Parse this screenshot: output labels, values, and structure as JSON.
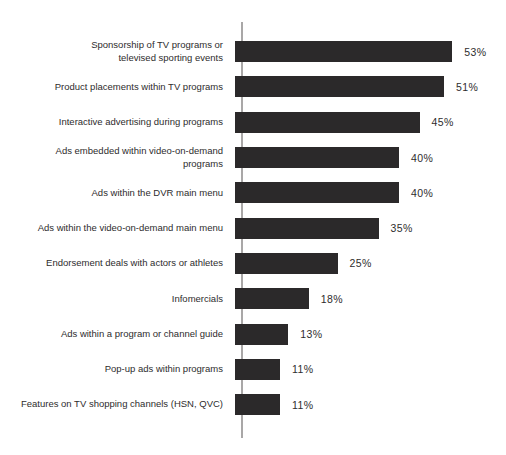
{
  "chart_data": {
    "type": "bar",
    "orientation": "horizontal",
    "title": "",
    "xlabel": "",
    "ylabel": "",
    "unit": "%",
    "xlim": [
      0,
      53
    ],
    "grid": false,
    "legend": null,
    "bar_color": "#2b292a",
    "axis_color": "#a9a7a7",
    "text_color": "#2e2c2d",
    "categories": [
      "Sponsorship of TV programs or\ntelevised sporting events",
      "Product placements within TV programs",
      "Interactive advertising during programs",
      "Ads embedded within video-on-demand\nprograms",
      "Ads within the DVR main menu",
      "Ads within the video-on-demand main menu",
      "Endorsement deals with actors or athletes",
      "Infomercials",
      "Ads within a program or channel guide",
      "Pop-up ads within programs",
      "Features on TV shopping channels (HSN, QVC)"
    ],
    "values": [
      53,
      51,
      45,
      40,
      40,
      35,
      25,
      18,
      13,
      11,
      11
    ],
    "value_labels": [
      "53%",
      "51%",
      "45%",
      "40%",
      "40%",
      "35%",
      "25%",
      "18%",
      "13%",
      "11%",
      "11%"
    ]
  }
}
